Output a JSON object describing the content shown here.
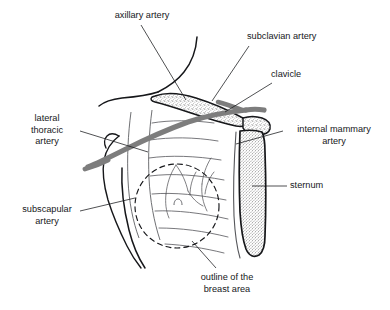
{
  "figure": {
    "background_color": "#ffffff",
    "ink_color": "#16171a",
    "artery_color": "#7d7d7d",
    "bone_fill": "#f2f2f2",
    "stipple_color": "#4a4a4a"
  },
  "labels": {
    "axillary_artery": {
      "text": "axillary artery"
    },
    "subclavian_artery": {
      "text": "subclavian artery"
    },
    "clavicle": {
      "text": "clavicle"
    },
    "internal_mammary_artery": {
      "line1": "internal mammary",
      "line2": "artery"
    },
    "sternum": {
      "text": "sternum"
    },
    "lateral_thoracic_artery": {
      "line1": "lateral",
      "line2": "thoracic",
      "line3": "artery"
    },
    "subscapular_artery": {
      "line1": "subscapular",
      "line2": "artery"
    },
    "outline_of_breast_area": {
      "line1": "outline of the",
      "line2": "breast area"
    }
  },
  "structures": [
    {
      "name": "clavicle",
      "type": "bone",
      "rendering": "stippled"
    },
    {
      "name": "sternum",
      "type": "bone",
      "rendering": "stippled"
    },
    {
      "name": "axillary-artery",
      "type": "vessel",
      "rendering": "thick-gray"
    },
    {
      "name": "subclavian-artery",
      "type": "vessel",
      "rendering": "thick-gray"
    },
    {
      "name": "lateral-thoracic-artery",
      "type": "vessel",
      "rendering": "thick-gray"
    },
    {
      "name": "internal-mammary-artery",
      "type": "vessel",
      "rendering": "thin-line"
    },
    {
      "name": "subscapular-artery",
      "type": "vessel",
      "rendering": "thin-line"
    },
    {
      "name": "breast-outline",
      "type": "landmark",
      "rendering": "dashed-circle"
    },
    {
      "name": "ribs",
      "type": "skeletal",
      "rendering": "thin-line"
    },
    {
      "name": "torso-outline",
      "type": "body-contour",
      "rendering": "thin-line"
    }
  ]
}
